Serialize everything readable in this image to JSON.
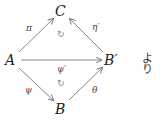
{
  "diagram": {
    "type": "commutative-diagram",
    "nodes": {
      "A": "A",
      "B": "B",
      "B_prime": "B′",
      "C": "C"
    },
    "edges": [
      {
        "from": "A",
        "to": "C",
        "label": "π"
      },
      {
        "from": "B_prime",
        "to": "C",
        "label": "η′"
      },
      {
        "from": "A",
        "to": "B_prime",
        "label": "ψ′"
      },
      {
        "from": "A",
        "to": "B",
        "label": "ψ"
      },
      {
        "from": "B",
        "to": "B_prime",
        "label": "θ"
      }
    ],
    "commute_markers": [
      "↻",
      "↻"
    ],
    "trailing_text": "より"
  },
  "colors": {
    "arrow": "#7a7a7a",
    "text": "#222222"
  }
}
